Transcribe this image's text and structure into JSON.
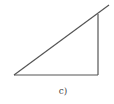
{
  "diagram": {
    "label": "c)",
    "shape": "right-triangle",
    "stroke_color": "#555555",
    "points": {
      "bottom_left": [
        14,
        75
      ],
      "bottom_right": [
        98,
        75
      ],
      "top_right": [
        98,
        14
      ],
      "hypotenuse_extension_end": [
        109,
        5
      ]
    }
  }
}
